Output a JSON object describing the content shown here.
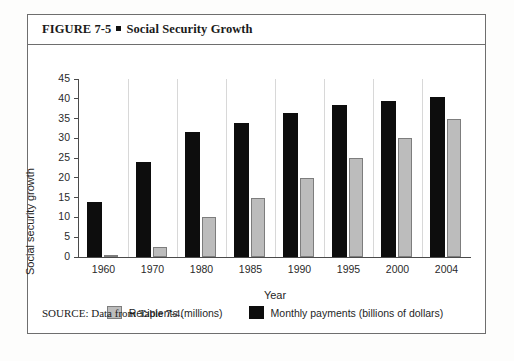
{
  "figure": {
    "label": "FIGURE 7-5",
    "separator": "square-bullet",
    "title": "Social Security Growth",
    "source": "SOURCE: Data from Table 7-4."
  },
  "colors": {
    "recipients": "#bcbcbc",
    "recipients_border": "#7d7d7d",
    "payments": "#0d0d0d",
    "axis": "#4a4a4a",
    "frame": "#6e6e6e",
    "background": "#ffffff"
  },
  "chart_data": {
    "type": "bar",
    "title": "Social Security Growth",
    "xlabel": "Year",
    "ylabel": "Social security growth",
    "categories": [
      "1960",
      "1970",
      "1980",
      "1985",
      "1990",
      "1995",
      "2000",
      "2004"
    ],
    "series": [
      {
        "name": "Recipients (millions)",
        "color": "#bcbcbc",
        "values": [
          0.5,
          2.5,
          10,
          15,
          20,
          25,
          30,
          35
        ]
      },
      {
        "name": "Monthly payments (billions of dollars)",
        "color": "#0d0d0d",
        "values": [
          14,
          24,
          31.5,
          34,
          36.5,
          38.5,
          39.5,
          40.5
        ]
      }
    ],
    "ylim": [
      0,
      45
    ],
    "yticks": [
      0,
      5,
      10,
      15,
      20,
      25,
      30,
      35,
      40,
      45
    ],
    "ytick_labels": [
      "0",
      "5",
      "10",
      "15",
      "20",
      "25",
      "30",
      "35",
      "40",
      "45"
    ],
    "grid": false,
    "legend_position": "bottom"
  }
}
